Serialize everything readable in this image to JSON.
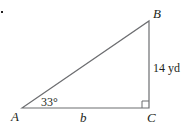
{
  "diagram": {
    "type": "right-triangle",
    "vertices": {
      "A": {
        "label": "A"
      },
      "B": {
        "label": "B"
      },
      "C": {
        "label": "C"
      }
    },
    "angle_A": "33°",
    "side_BC": "14 yd",
    "side_AC": "b",
    "right_angle_at": "C",
    "colors": {
      "stroke": "#6d6e71",
      "text": "#231f20"
    }
  }
}
